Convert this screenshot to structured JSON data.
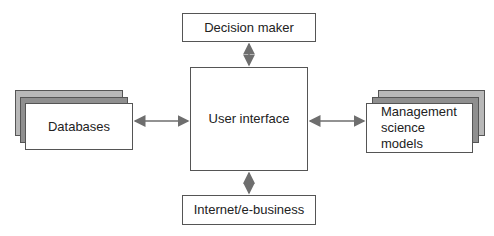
{
  "diagram": {
    "nodes": {
      "decision_maker": {
        "label": "Decision maker"
      },
      "user_interface": {
        "label": "User interface"
      },
      "internet": {
        "label": "Internet/e-business"
      },
      "databases": {
        "label": "Databases"
      },
      "models": {
        "label": "Management science models"
      }
    },
    "edges": [
      {
        "from": "decision_maker",
        "to": "user_interface",
        "type": "bidirectional"
      },
      {
        "from": "databases",
        "to": "user_interface",
        "type": "bidirectional"
      },
      {
        "from": "user_interface",
        "to": "models",
        "type": "bidirectional"
      },
      {
        "from": "user_interface",
        "to": "internet",
        "type": "bidirectional"
      }
    ],
    "colors": {
      "line": "#555555",
      "arrow": "#777777",
      "stack_back": "#b8b8b8",
      "stack_mid": "#8f8f8f"
    }
  }
}
